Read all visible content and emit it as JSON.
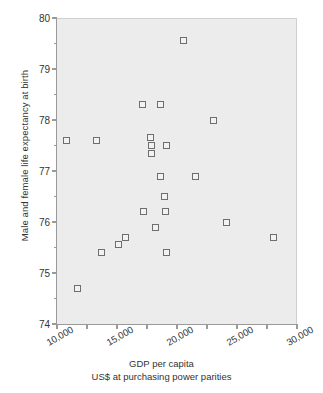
{
  "chart_data": {
    "type": "scatter",
    "title": "",
    "xlabel": "GDP per capita",
    "xlabel_sub": "US$ at purchasing power parities",
    "ylabel": "Male and female life expectancy at birth",
    "xlim": [
      10000,
      30000
    ],
    "ylim": [
      74,
      80
    ],
    "xticks": [
      10000,
      12500,
      15000,
      17500,
      20000,
      22500,
      25000,
      27500,
      30000
    ],
    "xticklabels": [
      "10,000",
      "",
      "15,000",
      "",
      "20,000",
      "",
      "25,000",
      "",
      "30,000"
    ],
    "yticks": [
      74,
      74.5,
      75,
      75.5,
      76,
      76.5,
      77,
      77.5,
      78,
      78.5,
      79,
      79.5,
      80
    ],
    "yticklabels": [
      "74",
      "",
      "75",
      "",
      "76",
      "",
      "77",
      "",
      "78",
      "",
      "79",
      "",
      "80"
    ],
    "grid": false,
    "legend": null,
    "marker": "open-square",
    "marker_color": "#6e6e6e",
    "plot_background": "#ececec",
    "points": [
      {
        "x": 10800,
        "y": 77.6
      },
      {
        "x": 11700,
        "y": 74.7
      },
      {
        "x": 13300,
        "y": 77.6
      },
      {
        "x": 13700,
        "y": 75.4
      },
      {
        "x": 15100,
        "y": 75.55
      },
      {
        "x": 15700,
        "y": 75.7
      },
      {
        "x": 17100,
        "y": 78.3
      },
      {
        "x": 17200,
        "y": 76.2
      },
      {
        "x": 17800,
        "y": 77.65
      },
      {
        "x": 17850,
        "y": 77.5
      },
      {
        "x": 17850,
        "y": 77.35
      },
      {
        "x": 18200,
        "y": 75.9
      },
      {
        "x": 18600,
        "y": 78.3
      },
      {
        "x": 18650,
        "y": 76.9
      },
      {
        "x": 18950,
        "y": 76.5
      },
      {
        "x": 19050,
        "y": 76.2
      },
      {
        "x": 19100,
        "y": 77.5
      },
      {
        "x": 19150,
        "y": 75.4
      },
      {
        "x": 20500,
        "y": 79.55
      },
      {
        "x": 21500,
        "y": 76.9
      },
      {
        "x": 23000,
        "y": 78.0
      },
      {
        "x": 24100,
        "y": 76.0
      },
      {
        "x": 28000,
        "y": 75.7
      }
    ]
  }
}
